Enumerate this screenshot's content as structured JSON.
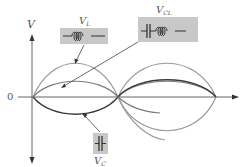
{
  "axes": {
    "y_label": "V",
    "zero_label": "0"
  },
  "labels": {
    "vl": {
      "main": "V",
      "sub": "L",
      "component": "inductor"
    },
    "vcl": {
      "main": "V",
      "sub": "CL",
      "component": "capacitor-inductor series"
    },
    "vc": {
      "main": "V",
      "sub": "C",
      "component": "capacitor"
    }
  },
  "colors": {
    "vl_curve": "#9a9a9a",
    "vcl_curve": "#7a7a7a",
    "vc_curve": "#3a3a3a",
    "axis": "#555555",
    "box_fill": "#c8c8c8"
  },
  "curves": {
    "vl": {
      "amplitude": 34,
      "phase": "positive-first"
    },
    "vcl": {
      "amplitude": 16,
      "phase": "positive-first"
    },
    "vc": {
      "amplitude": 18,
      "phase": "negative-first"
    }
  }
}
